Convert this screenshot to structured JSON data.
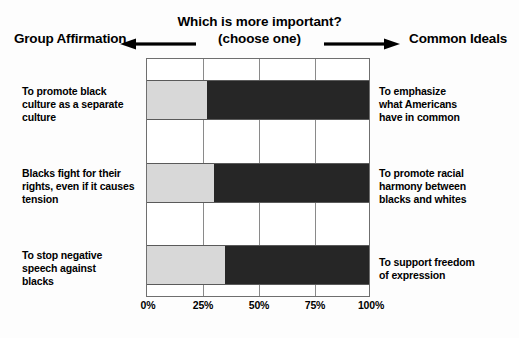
{
  "header": {
    "question_title": "Which is more important?",
    "question_sub": "(choose one)",
    "pole_left": "Group Affirmation",
    "pole_right": "Common Ideals",
    "arrow_left_icon": "arrow-left-icon",
    "arrow_right_icon": "arrow-right-icon"
  },
  "chart_data": {
    "type": "bar",
    "orientation": "horizontal",
    "stacked": true,
    "title": "Which is more important?",
    "subtitle": "(choose one)",
    "xlabel": "",
    "ylabel": "",
    "xlim": [
      0,
      100
    ],
    "grid": true,
    "legend_position": "none",
    "tick_labels": [
      "0%",
      "25%",
      "50%",
      "75%",
      "100%"
    ],
    "tick_values": [
      0,
      25,
      50,
      75,
      100
    ],
    "categories": [
      {
        "left_label": [
          "To promote black",
          "culture as a separate",
          "culture"
        ],
        "right_label": [
          "To emphasize",
          "what Americans",
          "have in common"
        ]
      },
      {
        "left_label": [
          "Blacks fight for their",
          "rights, even if it causes",
          "tension"
        ],
        "right_label": [
          "To promote racial",
          "harmony between",
          "blacks and whites"
        ]
      },
      {
        "left_label": [
          "To stop negative",
          "speech against",
          "blacks"
        ],
        "right_label": [
          "To support freedom",
          "of expression"
        ]
      }
    ],
    "series": [
      {
        "name": "Group Affirmation",
        "color": "#d8d8d8",
        "values": [
          27,
          30,
          35
        ]
      },
      {
        "name": "Common Ideals",
        "color": "#262626",
        "values": [
          73,
          70,
          65
        ]
      }
    ]
  },
  "colors": {
    "group_affirmation": "#d8d8d8",
    "common_ideals": "#262626",
    "axis": "#6f6f6f",
    "background": "#ffffff"
  }
}
